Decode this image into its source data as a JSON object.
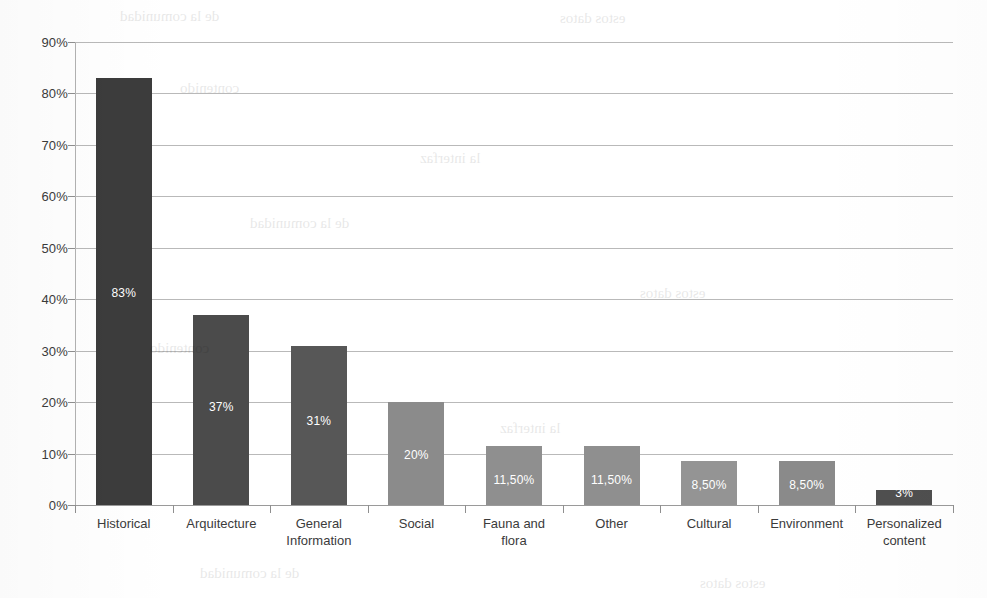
{
  "chart_data": {
    "type": "bar",
    "title": "",
    "subtitle": "",
    "xlabel": "",
    "ylabel": "",
    "ylim": [
      0,
      90
    ],
    "grid": true,
    "legend": "none",
    "y_tick_labels": [
      "0%",
      "10%",
      "20%",
      "30%",
      "40%",
      "50%",
      "60%",
      "70%",
      "80%",
      "90%"
    ],
    "y_tick_values": [
      0,
      10,
      20,
      30,
      40,
      50,
      60,
      70,
      80,
      90
    ],
    "categories": [
      "Historical",
      "Arquitecture",
      "General Information",
      "Social",
      "Fauna and flora",
      "Other",
      "Cultural",
      "Environment",
      "Personalized content"
    ],
    "values": [
      83,
      37,
      31,
      20,
      11.5,
      11.5,
      8.5,
      8.5,
      3
    ],
    "data_labels": [
      "83%",
      "37%",
      "31%",
      "20%",
      "11,50%",
      "11,50%",
      "8,50%",
      "8,50%",
      "3%"
    ],
    "bar_colors": [
      "#3c3c3c",
      "#4b4b4b",
      "#575757",
      "#8b8b8b",
      "#8f8f8f",
      "#8f8f8f",
      "#949494",
      "#8a8a8a",
      "#4f4f4f"
    ],
    "category_lines": [
      [
        "Historical"
      ],
      [
        "Arquitecture"
      ],
      [
        "General",
        "Information"
      ],
      [
        "Social"
      ],
      [
        "Fauna and",
        "flora"
      ],
      [
        "Other"
      ],
      [
        "Cultural"
      ],
      [
        "Environment"
      ],
      [
        "Personalized",
        "content"
      ]
    ],
    "axis_color": "#b2b2b2",
    "gridline_color": "#b9b9b9",
    "label_text_color": "#3b3b3b",
    "value_text_color": "#ffffff"
  },
  "scan_artifacts": {
    "bleed_lines": [
      "de la comunidad",
      "estos datos",
      "contenido",
      "la interfaz"
    ]
  }
}
